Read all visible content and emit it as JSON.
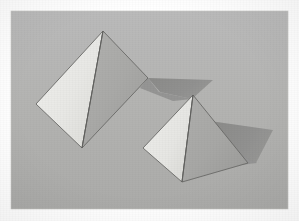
{
  "scene": {
    "title": "Two gray pyramids with cast shadows",
    "width": 299,
    "height": 221,
    "page_background": "#ffffff"
  },
  "panel": {
    "label": "illustration-panel",
    "x": 11,
    "y": 11,
    "width": 277,
    "height": 198,
    "fill": "#b4b4b2",
    "fill_top": "#b8b8b6",
    "fill_bottom": "#aeaeac",
    "border": "#c6c6c4"
  },
  "palette": {
    "background_gray": "#b4b4b2",
    "face_light": "#e9e9e6",
    "face_light_alt": "#e2e2de",
    "face_mid": "#a9a9a7",
    "face_mid_alt": "#a0a09e",
    "shadow_gray": "#8e8e8c",
    "shadow_gray_soft": "#949492",
    "outline_dark": "#5d5d5b",
    "outline_soft": "#7a7a78",
    "page_white": "#ffffff"
  },
  "objects": [
    {
      "name": "large-pyramid",
      "label": "Large pyramid",
      "apex": [
        103,
        31
      ],
      "left_base": [
        36,
        104
      ],
      "front_base": [
        82,
        148
      ],
      "right_base": [
        148,
        78
      ],
      "faces": [
        {
          "name": "left-face",
          "shading": "light",
          "fill": "#e9e9e6",
          "points": "103,31 36,104 82,148"
        },
        {
          "name": "right-face",
          "shading": "mid",
          "fill": "#a9a9a7",
          "points": "103,31 82,148 148,78"
        }
      ],
      "shadow": {
        "name": "large-pyramid-shadow",
        "fill": "#8e8e8c",
        "points": "148,78 213,80 192,99 160,92"
      }
    },
    {
      "name": "small-pyramid",
      "label": "Small pyramid",
      "apex": [
        193,
        95
      ],
      "left_base": [
        143,
        148
      ],
      "front_base": [
        182,
        182
      ],
      "right_base": [
        248,
        163
      ],
      "faces": [
        {
          "name": "left-face",
          "shading": "light",
          "fill": "#e9e9e6",
          "points": "193,95 143,148 182,182"
        },
        {
          "name": "right-face",
          "shading": "mid",
          "fill": "#a9a9a7",
          "points": "193,95 182,182 248,163"
        }
      ],
      "shadow": {
        "name": "small-pyramid-shadow",
        "fill": "#8e8e8c",
        "points": "210,121 273,130 256,163 229,150"
      }
    }
  ],
  "lighting": {
    "key_light_direction": "upper-left",
    "shadow_direction": "right",
    "description": "Light from the upper left; left faces bright, right faces mid-gray, shadows cast to the right."
  }
}
